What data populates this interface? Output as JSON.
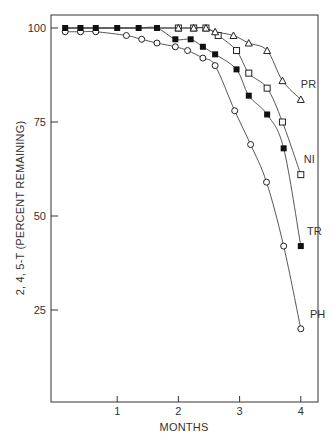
{
  "chart_data": {
    "type": "line",
    "title": "",
    "xlabel": "MONTHS",
    "ylabel": "2, 4, 5-T (PERCENT REMAINING)",
    "xlim": [
      0,
      4.3
    ],
    "ylim": [
      0,
      105
    ],
    "x_ticks": [
      1,
      2,
      3,
      4
    ],
    "y_ticks": [
      25,
      50,
      75,
      100
    ],
    "grid": false,
    "legend": "inline labels at line ends",
    "series": [
      {
        "name": "PH",
        "marker": "open-circle",
        "label_pos": [
          4.15,
          23
        ],
        "points": [
          [
            0.15,
            99
          ],
          [
            0.4,
            99
          ],
          [
            0.65,
            99
          ],
          [
            1.15,
            98
          ],
          [
            1.4,
            97
          ],
          [
            1.65,
            96
          ],
          [
            1.95,
            95
          ],
          [
            2.15,
            94
          ],
          [
            2.4,
            92
          ],
          [
            2.6,
            90
          ],
          [
            2.92,
            78
          ],
          [
            3.18,
            69
          ],
          [
            3.44,
            59
          ],
          [
            3.72,
            42
          ],
          [
            4.0,
            20
          ]
        ]
      },
      {
        "name": "TR",
        "marker": "filled-square",
        "label_pos": [
          4.1,
          45
        ],
        "points": [
          [
            0.15,
            100
          ],
          [
            0.4,
            100
          ],
          [
            0.65,
            100
          ],
          [
            1.0,
            100
          ],
          [
            1.35,
            100
          ],
          [
            1.65,
            100
          ],
          [
            1.95,
            97
          ],
          [
            2.2,
            97
          ],
          [
            2.4,
            95
          ],
          [
            2.6,
            93
          ],
          [
            2.95,
            89
          ],
          [
            3.15,
            82
          ],
          [
            3.45,
            77
          ],
          [
            3.72,
            68
          ],
          [
            4.0,
            42
          ]
        ]
      },
      {
        "name": "NI",
        "marker": "open-square",
        "label_pos": [
          4.05,
          64
        ],
        "points": [
          [
            2.0,
            100
          ],
          [
            2.25,
            100
          ],
          [
            2.45,
            100
          ],
          [
            2.65,
            98
          ],
          [
            2.95,
            94
          ],
          [
            3.15,
            88
          ],
          [
            3.45,
            84
          ],
          [
            3.7,
            75
          ],
          [
            4.0,
            61
          ]
        ]
      },
      {
        "name": "PR",
        "marker": "open-triangle",
        "label_pos": [
          4.0,
          84
        ],
        "points": [
          [
            2.0,
            100
          ],
          [
            2.25,
            100
          ],
          [
            2.45,
            100
          ],
          [
            2.6,
            99
          ],
          [
            2.9,
            98
          ],
          [
            3.15,
            96
          ],
          [
            3.45,
            94
          ],
          [
            3.7,
            86
          ],
          [
            4.0,
            81
          ]
        ]
      }
    ]
  }
}
